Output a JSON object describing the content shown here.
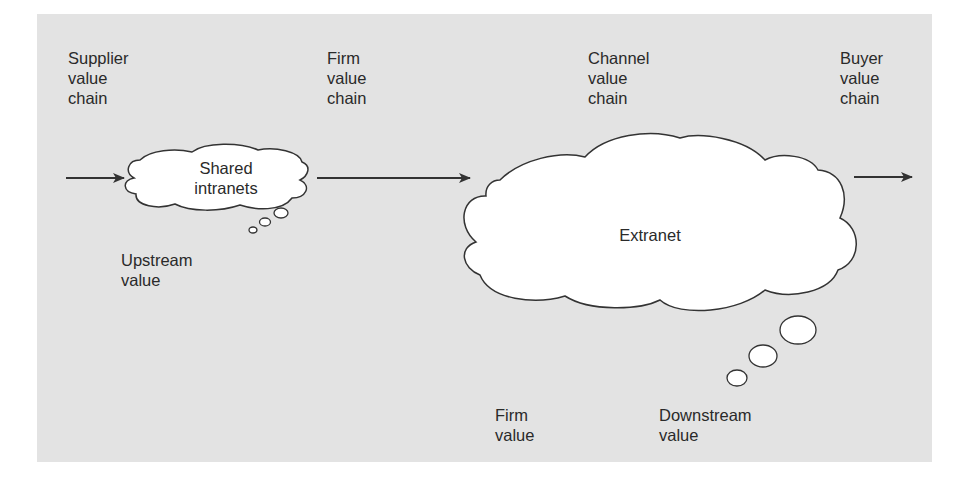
{
  "diagram": {
    "title_labels": {
      "supplier": "Supplier\nvalue\nchain",
      "firm": "Firm\nvalue\nchain",
      "channel": "Channel\nvalue\nchain",
      "buyer": "Buyer\nvalue\nchain"
    },
    "clouds": {
      "shared_intranets": "Shared\nintranets",
      "extranet": "Extranet"
    },
    "value_labels": {
      "upstream": "Upstream\nvalue",
      "firm": "Firm\nvalue",
      "downstream": "Downstream\nvalue"
    },
    "colors": {
      "panel_background": "#e3e3e3",
      "cloud_fill": "#ffffff",
      "stroke": "#333333",
      "text": "#2a2a2a"
    }
  }
}
